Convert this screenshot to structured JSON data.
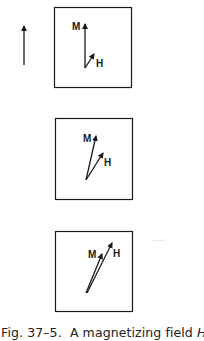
{
  "figure": {
    "field_arrow_label": "",
    "panels": [
      {
        "m_label": "M",
        "h_label": "H"
      },
      {
        "m_label": "M",
        "h_label": "H"
      },
      {
        "m_label": "M",
        "h_label": "H"
      }
    ],
    "caption": {
      "prefix": "Fig. 37–5.",
      "text_before": "A magnetizing field ",
      "symbol": "H",
      "text_after": " at"
    }
  }
}
